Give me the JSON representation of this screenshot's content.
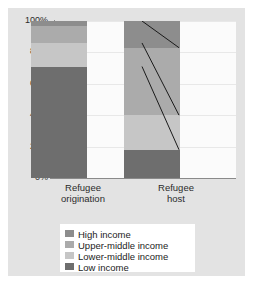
{
  "chart_data": {
    "type": "bar",
    "subtype": "stacked-100-percent",
    "title": "",
    "xlabel": "",
    "ylabel": "",
    "ylim": [
      0,
      100
    ],
    "ytick_labels": [
      "0%",
      "20%",
      "40%",
      "60%",
      "80%",
      "100%"
    ],
    "ytick_values": [
      0,
      20,
      40,
      60,
      80,
      100
    ],
    "grid": true,
    "legend_position": "bottom",
    "categories": [
      "Refugee origination",
      "Refugee host"
    ],
    "category_lines": [
      [
        "Refugee",
        "origination"
      ],
      [
        "Refugee",
        "host"
      ]
    ],
    "series": [
      {
        "name": "Low income",
        "color": "#6e6e6e",
        "values": [
          71,
          18
        ]
      },
      {
        "name": "Lower-middle income",
        "color": "#c6c6c6",
        "values": [
          15,
          22
        ]
      },
      {
        "name": "Upper-middle income",
        "color": "#ababab",
        "values": [
          11,
          43
        ]
      },
      {
        "name": "High income",
        "color": "#8d8d8d",
        "values": [
          3,
          17
        ]
      }
    ],
    "stack_order_bottom_to_top": [
      "Low income",
      "Lower-middle income",
      "Upper-middle income",
      "High income"
    ],
    "cumulative_boundaries": {
      "Refugee origination": [
        0,
        71,
        86,
        97,
        100
      ],
      "Refugee host": [
        0,
        18,
        40,
        83,
        100
      ]
    },
    "connector_lines": [
      {
        "from_percent": 100,
        "to_percent": 83
      },
      {
        "from_percent": 86,
        "to_percent": 40
      },
      {
        "from_percent": 71,
        "to_percent": 18
      }
    ],
    "connector_color": "#1a1a1a"
  },
  "legend": {
    "items": [
      {
        "label": "High income",
        "color": "#8d8d8d"
      },
      {
        "label": "Upper-middle income",
        "color": "#ababab"
      },
      {
        "label": "Lower-middle income",
        "color": "#c6c6c6"
      },
      {
        "label": "Low income",
        "color": "#6e6e6e"
      }
    ]
  },
  "colors": {
    "panel_background": "#e3e3e3",
    "plot_background": "#fbfbfb",
    "axis": "#8a8a8a",
    "grid": "#e8e8e8",
    "text": "#2b2b2b",
    "legend_background": "#ffffff"
  }
}
